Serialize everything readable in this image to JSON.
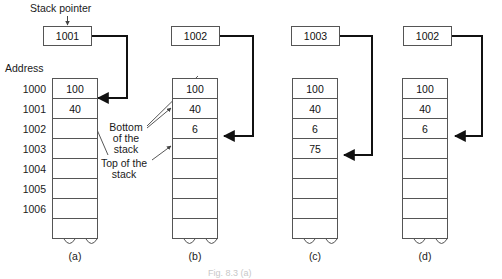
{
  "figure": {
    "width": 502,
    "height": 279,
    "stack_pointer_label": "Stack pointer",
    "address_label": "Address",
    "bottom_annotation": "Bottom of the stack",
    "top_annotation": "Top of the stack",
    "caption": "Fig. 8.3 (a)",
    "line_color": "#555555",
    "arrow_color": "#111111",
    "text_color": "#1a1a1a"
  },
  "addresses": [
    "1000",
    "1001",
    "1002",
    "1003",
    "1004",
    "1005",
    "1006"
  ],
  "panels": [
    {
      "id": "a",
      "label": "(a)",
      "pointer_value": "1001",
      "show_addresses": true,
      "cells": [
        "100",
        "40",
        "",
        "",
        "",
        "",
        "",
        ""
      ],
      "arrow_target_index": 1
    },
    {
      "id": "b",
      "label": "(b)",
      "pointer_value": "1002",
      "show_addresses": false,
      "cells": [
        "100",
        "40",
        "6",
        "",
        "",
        "",
        "",
        ""
      ],
      "arrow_target_index": 2
    },
    {
      "id": "c",
      "label": "(c)",
      "pointer_value": "1003",
      "show_addresses": false,
      "cells": [
        "100",
        "40",
        "6",
        "75",
        "",
        "",
        "",
        ""
      ],
      "arrow_target_index": 3
    },
    {
      "id": "d",
      "label": "(d)",
      "pointer_value": "1002",
      "show_addresses": false,
      "cells": [
        "100",
        "40",
        "6",
        "",
        "",
        "",
        "",
        ""
      ],
      "arrow_target_index": 2
    }
  ]
}
